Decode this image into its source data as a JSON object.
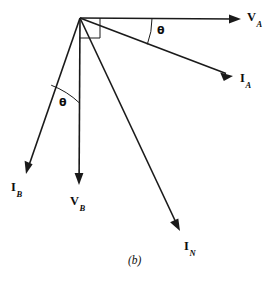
{
  "figure": {
    "caption": "(b)",
    "type": "phasor-diagram",
    "background_color": "#ffffff",
    "stroke_color": "#1a1a1a",
    "origin": {
      "x": 80,
      "y": 18
    },
    "right_angle_marker": {
      "size": 20,
      "present": true
    }
  },
  "vectors": [
    {
      "id": "VA",
      "label_main": "V",
      "label_sub": "A",
      "quantity": "voltage",
      "phase": "A",
      "from": {
        "x": 80,
        "y": 18
      },
      "to": {
        "x": 241,
        "y": 19
      },
      "angle_deg": 0,
      "label_pos": {
        "x": 247,
        "y": 12
      }
    },
    {
      "id": "IA",
      "label_main": "I",
      "label_sub": "A",
      "quantity": "current",
      "phase": "A",
      "from": {
        "x": 80,
        "y": 18
      },
      "to": {
        "x": 233,
        "y": 76
      },
      "angle_deg": -20.8,
      "label_pos": {
        "x": 240,
        "y": 73
      }
    },
    {
      "id": "IB",
      "label_main": "I",
      "label_sub": "B",
      "quantity": "current",
      "phase": "B",
      "from": {
        "x": 80,
        "y": 18
      },
      "to": {
        "x": 26,
        "y": 174
      },
      "angle_deg": -109.1,
      "label_pos": {
        "x": 11,
        "y": 182
      }
    },
    {
      "id": "VB",
      "label_main": "V",
      "label_sub": "B",
      "quantity": "voltage",
      "phase": "B",
      "from": {
        "x": 80,
        "y": 18
      },
      "to": {
        "x": 79,
        "y": 185
      },
      "angle_deg": -90,
      "label_pos": {
        "x": 71,
        "y": 196
      }
    },
    {
      "id": "IN",
      "label_main": "I",
      "label_sub": "N",
      "quantity": "current",
      "phase": "N",
      "from": {
        "x": 80,
        "y": 18
      },
      "to": {
        "x": 180,
        "y": 231
      },
      "angle_deg": -64.8,
      "label_pos": {
        "x": 184,
        "y": 240
      }
    }
  ],
  "angles": [
    {
      "id": "theta-a",
      "symbol": "θ",
      "between": [
        "VA",
        "IA"
      ],
      "label_pos": {
        "x": 157,
        "y": 26
      },
      "arc": {
        "radius": 72,
        "start_deg": 0,
        "end_deg": -20.8
      }
    },
    {
      "id": "theta-b",
      "symbol": "θ",
      "between": [
        "IB",
        "VB"
      ],
      "label_pos": {
        "x": 59,
        "y": 98
      },
      "arc": {
        "radius": 85,
        "start_deg": -90,
        "end_deg": -109.1
      }
    }
  ]
}
